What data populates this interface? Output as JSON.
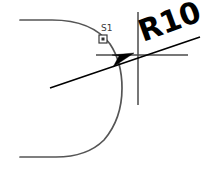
{
  "drawing": {
    "title": "CAD Radius Dimension Detail",
    "background_color": "#ffffff",
    "width": 212,
    "height": 171,
    "dimension": {
      "label": "R10",
      "prefix": "R",
      "value": "10",
      "color": "#000000",
      "rotation_degrees": -20
    },
    "point_label": {
      "label": "S1",
      "color": "#3a3a3a",
      "marker_shape": "square"
    },
    "profile": {
      "name": "rounded-c-profile",
      "color": "#555555",
      "stroke_width": 1.7
    },
    "crosshair": {
      "name": "center-mark",
      "color": "#4a4a4a",
      "center_x": 138,
      "center_y": 55
    },
    "leader": {
      "name": "radius-leader",
      "color": "#000000",
      "arrow_style": "solid-filled"
    }
  }
}
